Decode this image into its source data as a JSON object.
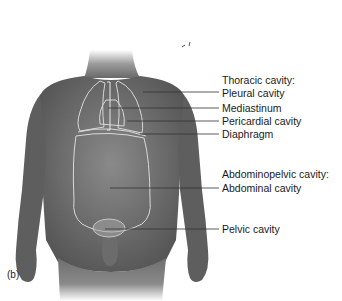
{
  "figure": {
    "panel_label": "(b)",
    "groups": [
      {
        "heading": "Thoracic cavity:",
        "items": [
          {
            "label": "Pleural cavity",
            "line_y": 92,
            "pointer_x": 143
          },
          {
            "label": "Mediastinum",
            "line_y": 108,
            "pointer_x": 108
          },
          {
            "label": "Pericardial cavity",
            "line_y": 121,
            "pointer_x": 127
          },
          {
            "label": "Diaphragm",
            "line_y": 134,
            "pointer_x": 140
          }
        ]
      },
      {
        "heading": "Abdominopelvic cavity:",
        "items": [
          {
            "label": "Abdominal cavity",
            "line_y": 188,
            "pointer_x": 110
          },
          {
            "label": "Pelvic cavity",
            "line_y": 229,
            "pointer_x": 105
          }
        ]
      }
    ],
    "colors": {
      "skin_dark": "#5a5a5a",
      "skin_mid": "#7a7a7a",
      "skin_light": "#9a9a9a",
      "cavity_outline": "#d8d8d8",
      "leader_line": "#333333",
      "text": "#1a1a1a"
    }
  }
}
